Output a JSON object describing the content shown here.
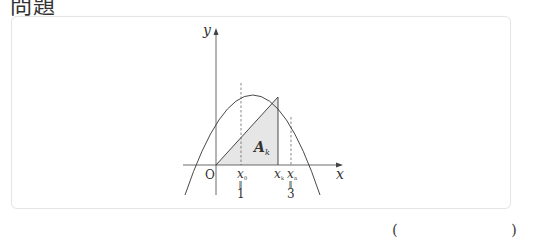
{
  "header": {
    "title": "問題"
  },
  "figure": {
    "axis_labels": {
      "x": "x",
      "y": "y",
      "origin": "O"
    },
    "region_label": {
      "main": "A",
      "sub": "k"
    },
    "points": [
      {
        "name": "x0",
        "main": "x",
        "sub": "0",
        "equals_symbol": "‖",
        "value": "1"
      },
      {
        "name": "xk",
        "main": "x",
        "sub": "k"
      },
      {
        "name": "xn",
        "main": "x",
        "sub": "n",
        "equals_symbol": "‖",
        "value": "3"
      }
    ],
    "colors": {
      "stroke": "#333333",
      "shade": "#e6e6e6",
      "dashed": "#555555"
    }
  },
  "answer": {
    "open": "(",
    "close": ")"
  }
}
